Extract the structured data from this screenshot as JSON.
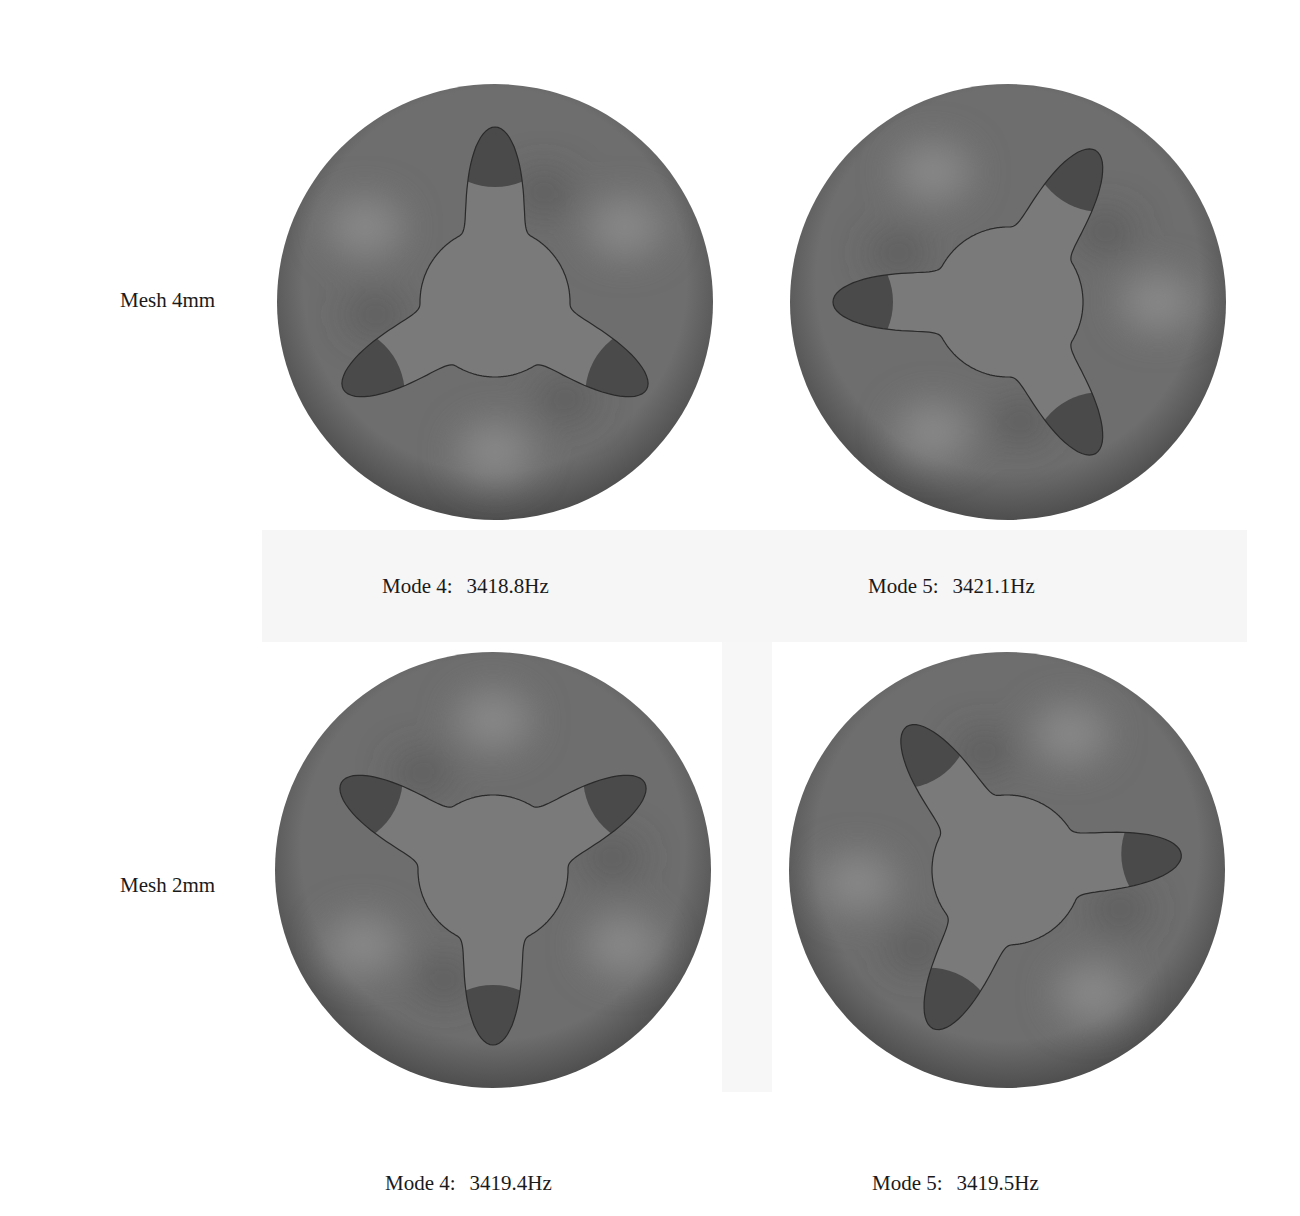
{
  "figure": {
    "rows": [
      {
        "label": "Mesh 4mm",
        "modes": [
          {
            "mode": "Mode 4:",
            "frequency": "3418.8Hz",
            "lobes": 3,
            "rotation_deg": 0
          },
          {
            "mode": "Mode 5:",
            "frequency": "3421.1Hz",
            "lobes": 3,
            "rotation_deg": 30
          }
        ]
      },
      {
        "label": "Mesh 2mm",
        "modes": [
          {
            "mode": "Mode 4:",
            "frequency": "3419.4Hz",
            "lobes": 3,
            "rotation_deg": 180
          },
          {
            "mode": "Mode 5:",
            "frequency": "3419.5Hz",
            "lobes": 3,
            "rotation_deg": -35
          }
        ]
      }
    ],
    "colors": {
      "disk_base": "#6e6e6e",
      "disk_light": "#8c8c8c",
      "disk_dark": "#4e4e4e",
      "lobe_fill": "#4a4a4a",
      "center_fill": "#7a7a7a",
      "outline": "#2a2a2a"
    }
  }
}
